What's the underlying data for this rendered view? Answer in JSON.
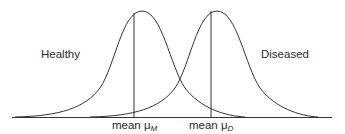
{
  "diagram": {
    "labels": {
      "healthy": "Healthy",
      "diseased": "Diseased"
    },
    "means": [
      {
        "prefix": "mean μ",
        "subscript": "M"
      },
      {
        "prefix": "mean μ",
        "subscript": "D"
      }
    ]
  }
}
